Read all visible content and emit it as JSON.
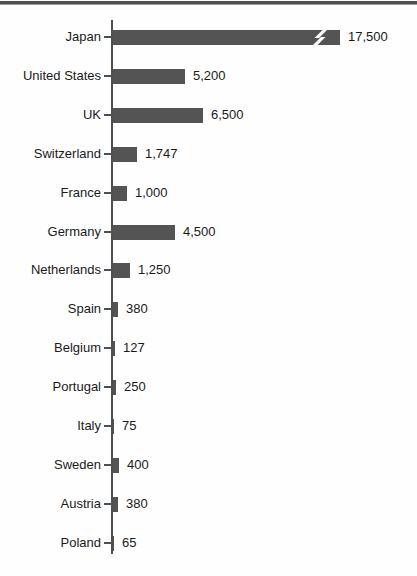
{
  "chart_data": {
    "type": "bar",
    "orientation": "horizontal",
    "title": "",
    "xlabel": "",
    "ylabel": "",
    "grid": false,
    "legend_position": "none",
    "bar_color": "#545454",
    "categories": [
      "Japan",
      "United States",
      "UK",
      "Switzerland",
      "France",
      "Germany",
      "Netherlands",
      "Spain",
      "Belgium",
      "Portugal",
      "Italy",
      "Sweden",
      "Austria",
      "Poland"
    ],
    "values": [
      17500,
      5200,
      6500,
      1747,
      1000,
      4500,
      1250,
      380,
      127,
      250,
      75,
      400,
      380,
      65
    ],
    "value_labels": [
      "17,500",
      "5,200",
      "6,500",
      "1,747",
      "1,000",
      "4,500",
      "1,250",
      "380",
      "127",
      "250",
      "75",
      "400",
      "380",
      "65"
    ],
    "axis_break": {
      "category": "Japan",
      "symbol": "lightning-break",
      "note": "Japan bar is drawn truncated with a white break (bolt) symbol near its right end"
    }
  },
  "colors": {
    "bar": "#545454",
    "axis": "#4f4f4f",
    "text": "#1a1a1a",
    "top_rule": "#4f4f4f",
    "background": "#fefefe",
    "break_symbol": "#ffffff"
  }
}
